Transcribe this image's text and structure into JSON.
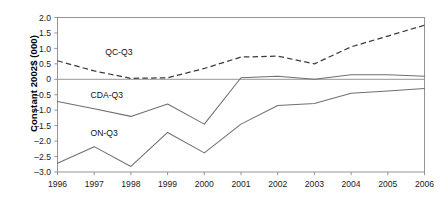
{
  "chart_data": {
    "type": "line",
    "title": "",
    "xlabel": "",
    "ylabel": "Constant 2002$ (000)",
    "categories": [
      "1996",
      "1997",
      "1998",
      "1999",
      "2000",
      "2001",
      "2002",
      "2003",
      "2004",
      "2005",
      "2006"
    ],
    "x": [
      1996,
      1997,
      1998,
      1999,
      2000,
      2001,
      2002,
      2003,
      2004,
      2005,
      2006
    ],
    "ylim": [
      -3.0,
      2.0
    ],
    "xlim": [
      1996,
      2006
    ],
    "yticks": [
      "2.0",
      "1.5",
      "1.0",
      "0.5",
      "0",
      "-0.5",
      "-1.0",
      "-1.5",
      "-2.0",
      "-2.5",
      "-3.0"
    ],
    "ytick_values": [
      2.0,
      1.5,
      1.0,
      0.5,
      0,
      -0.5,
      -1.0,
      -1.5,
      -2.0,
      -2.5,
      -3.0
    ],
    "grid": false,
    "legend_position": "inline-annotations",
    "zero_line": 0,
    "series": [
      {
        "name": "QC-Q3",
        "style": "dashed",
        "color": "#3a3a3a",
        "label_x": 1997.3,
        "label_y": 0.78,
        "values": [
          0.6,
          0.27,
          0.03,
          0.05,
          0.35,
          0.72,
          0.75,
          0.5,
          1.05,
          1.4,
          1.75
        ]
      },
      {
        "name": "CDA-Q3",
        "style": "solid",
        "color": "#6f6f6f",
        "label_x": 1996.9,
        "label_y": -0.62,
        "values": [
          -0.72,
          -0.95,
          -1.2,
          -0.8,
          -1.45,
          0.05,
          0.1,
          0.0,
          0.15,
          0.15,
          0.1
        ]
      },
      {
        "name": "ON-Q3",
        "style": "solid",
        "color": "#6f6f6f",
        "label_x": 1996.9,
        "label_y": -1.82,
        "values": [
          -2.72,
          -2.18,
          -2.82,
          -1.72,
          -2.38,
          -1.45,
          -0.85,
          -0.78,
          -0.45,
          -0.38,
          -0.3
        ]
      }
    ]
  }
}
